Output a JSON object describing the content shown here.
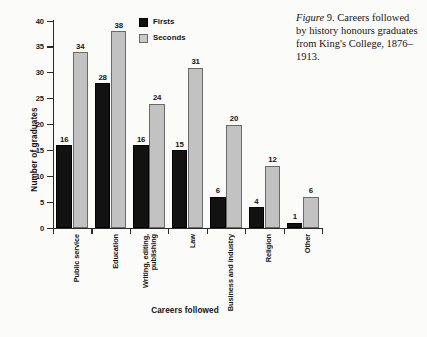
{
  "caption": {
    "figure_label": "Figure",
    "figure_number": "9.",
    "text": "Careers followed by history honours graduates from King's College, 1876–1913."
  },
  "legend": {
    "position": "top-center",
    "entries": [
      {
        "label": "Firsts",
        "color": "#121212"
      },
      {
        "label": "Seconds",
        "color": "#c2c2c2"
      }
    ]
  },
  "axes": {
    "ylabel": "Number of graduates",
    "xlabel": "Careers followed",
    "yticks": [
      "0",
      "5",
      "10",
      "15",
      "20",
      "25",
      "30",
      "35",
      "40"
    ]
  },
  "chart_data": {
    "type": "bar",
    "title": "",
    "xlabel": "Careers followed",
    "ylabel": "Number of graduates",
    "ylim": [
      0,
      40
    ],
    "ytick_step": 5,
    "grid": false,
    "legend_position": "top-center",
    "categories": [
      "Public service",
      "Education",
      "Writing, editing, publishing",
      "Law",
      "Business and industry",
      "Religion",
      "Other"
    ],
    "category_lines": [
      [
        "Public service"
      ],
      [
        "Education"
      ],
      [
        "Writing, editing,",
        "publishing"
      ],
      [
        "Law"
      ],
      [
        "Business and industry"
      ],
      [
        "Religion"
      ],
      [
        "Other"
      ]
    ],
    "series": [
      {
        "name": "Firsts",
        "color": "#121212",
        "values": [
          16,
          28,
          16,
          15,
          6,
          4,
          1
        ]
      },
      {
        "name": "Seconds",
        "color": "#c2c2c2",
        "values": [
          34,
          38,
          24,
          31,
          20,
          12,
          6
        ]
      }
    ]
  }
}
